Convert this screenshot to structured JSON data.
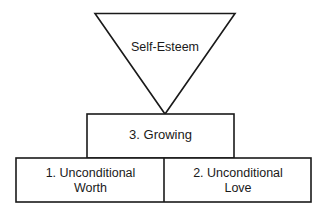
{
  "diagram": {
    "type": "pyramid-hierarchy",
    "background_color": "#ffffff",
    "line_color": "#1a1a1a",
    "text_color": "#1a1a1a",
    "apex": {
      "shape": "inverted-triangle",
      "label": "Self-Esteem"
    },
    "levels": [
      {
        "level": 2,
        "nodes": [
          {
            "label": "3. Growing",
            "shape": "rectangle"
          }
        ]
      },
      {
        "level": 1,
        "nodes": [
          {
            "label": "1. Unconditional\nWorth",
            "shape": "rectangle"
          },
          {
            "label": "2. Unconditional\nLove",
            "shape": "rectangle"
          }
        ]
      }
    ]
  }
}
